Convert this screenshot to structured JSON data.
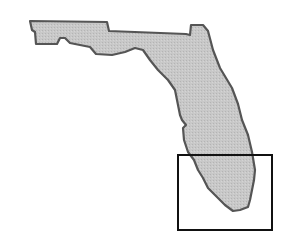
{
  "map": {
    "region": "Florida",
    "highlighted_area": "South Florida",
    "colors": {
      "background": "#ffffff",
      "state_fill": "#c4c4c4",
      "state_outline": "#555555",
      "highlight_box_stroke": "#111111"
    },
    "state_outline_points": "30,21 107,22 109,31 186,34 190,35 191,25 203,25 208,31 213,50 220,68 232,88 238,104 242,120 248,135 252,152 255,170 254,180 252,190 250,200 248,207 240,210 233,211 225,205 215,195 208,188 203,178 198,170 194,160 188,152 184,140 183,128 186,125 182,120 180,115 178,105 175,90 168,80 158,70 150,60 143,50 135,48 125,52 112,55 96,54 90,47 70,43 65,38 60,38 57,44 36,44 35,32 32,30",
    "highlight_box": {
      "x": 178,
      "y": 155,
      "width": 94,
      "height": 75
    }
  }
}
